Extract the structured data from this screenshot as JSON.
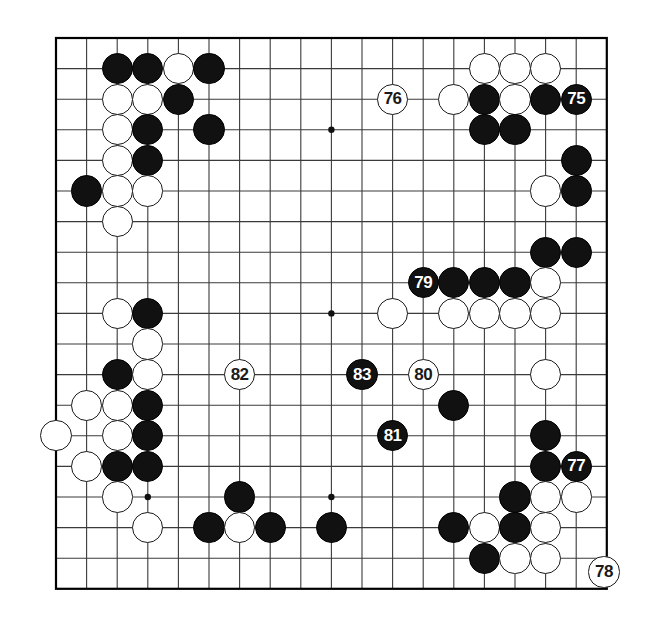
{
  "figure": {
    "kind": "go-board-diagram",
    "board_size": 19,
    "background_color": "#ffffff",
    "line_color": "#3a3a3a",
    "border_color": "#000000",
    "black_color": "#111111",
    "white_color": "#ffffff",
    "geometry": {
      "origin_x": 56,
      "origin_y": 38,
      "step": 30.6,
      "stone_radius": 15.6,
      "border_width": 2.2,
      "line_width": 1.1,
      "star_radius": 3.2
    },
    "star_points": [
      {
        "col": 4,
        "row": 4
      },
      {
        "col": 10,
        "row": 4
      },
      {
        "col": 16,
        "row": 4
      },
      {
        "col": 4,
        "row": 10
      },
      {
        "col": 10,
        "row": 10
      },
      {
        "col": 16,
        "row": 10
      },
      {
        "col": 4,
        "row": 16
      },
      {
        "col": 10,
        "row": 16
      },
      {
        "col": 16,
        "row": 16
      }
    ],
    "stones": [
      {
        "col": 3,
        "row": 2,
        "color": "black",
        "label": ""
      },
      {
        "col": 4,
        "row": 2,
        "color": "black",
        "label": ""
      },
      {
        "col": 5,
        "row": 2,
        "color": "white",
        "label": ""
      },
      {
        "col": 6,
        "row": 2,
        "color": "black",
        "label": ""
      },
      {
        "col": 15,
        "row": 2,
        "color": "white",
        "label": ""
      },
      {
        "col": 16,
        "row": 2,
        "color": "white",
        "label": ""
      },
      {
        "col": 17,
        "row": 2,
        "color": "white",
        "label": ""
      },
      {
        "col": 3,
        "row": 3,
        "color": "white",
        "label": ""
      },
      {
        "col": 4,
        "row": 3,
        "color": "white",
        "label": ""
      },
      {
        "col": 5,
        "row": 3,
        "color": "black",
        "label": ""
      },
      {
        "col": 12,
        "row": 3,
        "color": "white",
        "label": "76"
      },
      {
        "col": 14,
        "row": 3,
        "color": "white",
        "label": ""
      },
      {
        "col": 15,
        "row": 3,
        "color": "black",
        "label": ""
      },
      {
        "col": 16,
        "row": 3,
        "color": "white",
        "label": ""
      },
      {
        "col": 17,
        "row": 3,
        "color": "black",
        "label": ""
      },
      {
        "col": 18,
        "row": 3,
        "color": "black",
        "label": "75"
      },
      {
        "col": 3,
        "row": 4,
        "color": "white",
        "label": ""
      },
      {
        "col": 4,
        "row": 4,
        "color": "black",
        "label": ""
      },
      {
        "col": 6,
        "row": 4,
        "color": "black",
        "label": ""
      },
      {
        "col": 15,
        "row": 4,
        "color": "black",
        "label": ""
      },
      {
        "col": 16,
        "row": 4,
        "color": "black",
        "label": ""
      },
      {
        "col": 3,
        "row": 5,
        "color": "white",
        "label": ""
      },
      {
        "col": 4,
        "row": 5,
        "color": "black",
        "label": ""
      },
      {
        "col": 18,
        "row": 5,
        "color": "black",
        "label": ""
      },
      {
        "col": 2,
        "row": 6,
        "color": "black",
        "label": ""
      },
      {
        "col": 3,
        "row": 6,
        "color": "white",
        "label": ""
      },
      {
        "col": 4,
        "row": 6,
        "color": "white",
        "label": ""
      },
      {
        "col": 17,
        "row": 6,
        "color": "white",
        "label": ""
      },
      {
        "col": 18,
        "row": 6,
        "color": "black",
        "label": ""
      },
      {
        "col": 3,
        "row": 7,
        "color": "white",
        "label": ""
      },
      {
        "col": 17,
        "row": 8,
        "color": "black",
        "label": ""
      },
      {
        "col": 18,
        "row": 8,
        "color": "black",
        "label": ""
      },
      {
        "col": 13,
        "row": 9,
        "color": "black",
        "label": "79"
      },
      {
        "col": 14,
        "row": 9,
        "color": "black",
        "label": ""
      },
      {
        "col": 15,
        "row": 9,
        "color": "black",
        "label": ""
      },
      {
        "col": 16,
        "row": 9,
        "color": "black",
        "label": ""
      },
      {
        "col": 17,
        "row": 9,
        "color": "white",
        "label": ""
      },
      {
        "col": 3,
        "row": 10,
        "color": "white",
        "label": ""
      },
      {
        "col": 4,
        "row": 10,
        "color": "black",
        "label": ""
      },
      {
        "col": 12,
        "row": 10,
        "color": "white",
        "label": ""
      },
      {
        "col": 14,
        "row": 10,
        "color": "white",
        "label": ""
      },
      {
        "col": 15,
        "row": 10,
        "color": "white",
        "label": ""
      },
      {
        "col": 16,
        "row": 10,
        "color": "white",
        "label": ""
      },
      {
        "col": 17,
        "row": 10,
        "color": "white",
        "label": ""
      },
      {
        "col": 4,
        "row": 11,
        "color": "white",
        "label": ""
      },
      {
        "col": 3,
        "row": 12,
        "color": "black",
        "label": ""
      },
      {
        "col": 4,
        "row": 12,
        "color": "white",
        "label": ""
      },
      {
        "col": 7,
        "row": 12,
        "color": "white",
        "label": "82"
      },
      {
        "col": 11,
        "row": 12,
        "color": "black",
        "label": "83"
      },
      {
        "col": 13,
        "row": 12,
        "color": "white",
        "label": "80"
      },
      {
        "col": 17,
        "row": 12,
        "color": "white",
        "label": ""
      },
      {
        "col": 2,
        "row": 13,
        "color": "white",
        "label": ""
      },
      {
        "col": 3,
        "row": 13,
        "color": "white",
        "label": ""
      },
      {
        "col": 4,
        "row": 13,
        "color": "black",
        "label": ""
      },
      {
        "col": 14,
        "row": 13,
        "color": "black",
        "label": ""
      },
      {
        "col": 1,
        "row": 14,
        "color": "white",
        "label": ""
      },
      {
        "col": 3,
        "row": 14,
        "color": "white",
        "label": ""
      },
      {
        "col": 4,
        "row": 14,
        "color": "black",
        "label": ""
      },
      {
        "col": 12,
        "row": 14,
        "color": "black",
        "label": "81"
      },
      {
        "col": 17,
        "row": 14,
        "color": "black",
        "label": ""
      },
      {
        "col": 2,
        "row": 15,
        "color": "white",
        "label": ""
      },
      {
        "col": 3,
        "row": 15,
        "color": "black",
        "label": ""
      },
      {
        "col": 4,
        "row": 15,
        "color": "black",
        "label": ""
      },
      {
        "col": 17,
        "row": 15,
        "color": "black",
        "label": ""
      },
      {
        "col": 18,
        "row": 15,
        "color": "black",
        "label": "77"
      },
      {
        "col": 3,
        "row": 16,
        "color": "white",
        "label": ""
      },
      {
        "col": 7,
        "row": 16,
        "color": "black",
        "label": ""
      },
      {
        "col": 16,
        "row": 16,
        "color": "black",
        "label": ""
      },
      {
        "col": 17,
        "row": 16,
        "color": "white",
        "label": ""
      },
      {
        "col": 18,
        "row": 16,
        "color": "white",
        "label": ""
      },
      {
        "col": 4,
        "row": 17,
        "color": "white",
        "label": ""
      },
      {
        "col": 6,
        "row": 17,
        "color": "black",
        "label": ""
      },
      {
        "col": 7,
        "row": 17,
        "color": "white",
        "label": ""
      },
      {
        "col": 8,
        "row": 17,
        "color": "black",
        "label": ""
      },
      {
        "col": 10,
        "row": 17,
        "color": "black",
        "label": ""
      },
      {
        "col": 14,
        "row": 17,
        "color": "black",
        "label": ""
      },
      {
        "col": 15,
        "row": 17,
        "color": "white",
        "label": ""
      },
      {
        "col": 16,
        "row": 17,
        "color": "black",
        "label": ""
      },
      {
        "col": 17,
        "row": 17,
        "color": "white",
        "label": ""
      },
      {
        "col": 15,
        "row": 18,
        "color": "black",
        "label": ""
      },
      {
        "col": 16,
        "row": 18,
        "color": "white",
        "label": ""
      },
      {
        "col": 17,
        "row": 18,
        "color": "white",
        "label": ""
      }
    ],
    "off_board_stones": [
      {
        "x": 604,
        "y": 572,
        "color": "white",
        "label": "78"
      }
    ],
    "move_numbers": [
      "75",
      "76",
      "77",
      "78",
      "79",
      "80",
      "81",
      "82",
      "83"
    ]
  }
}
